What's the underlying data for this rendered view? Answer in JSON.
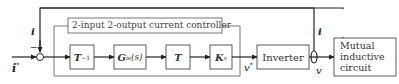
{
  "diagram": {
    "controller_title": "2-input 2-output current controller",
    "input_label": "i",
    "input_label_sup": "*",
    "feedback_label": "i",
    "feedback_label_right": "i",
    "minus_sign": "−",
    "blocks": {
      "t_inverse": {
        "base": "T",
        "sup": "−1"
      },
      "gis": {
        "base": "G",
        "sub": "is",
        "arg": "(s)"
      },
      "t": {
        "base": "T"
      },
      "kv": {
        "base": "K",
        "sub": "v"
      },
      "inverter": "Inverter",
      "circuit": [
        "Mutual",
        "inductive",
        "circuit"
      ]
    },
    "v_star_label": "v",
    "v_star_sup": "*",
    "v_label": "v"
  }
}
